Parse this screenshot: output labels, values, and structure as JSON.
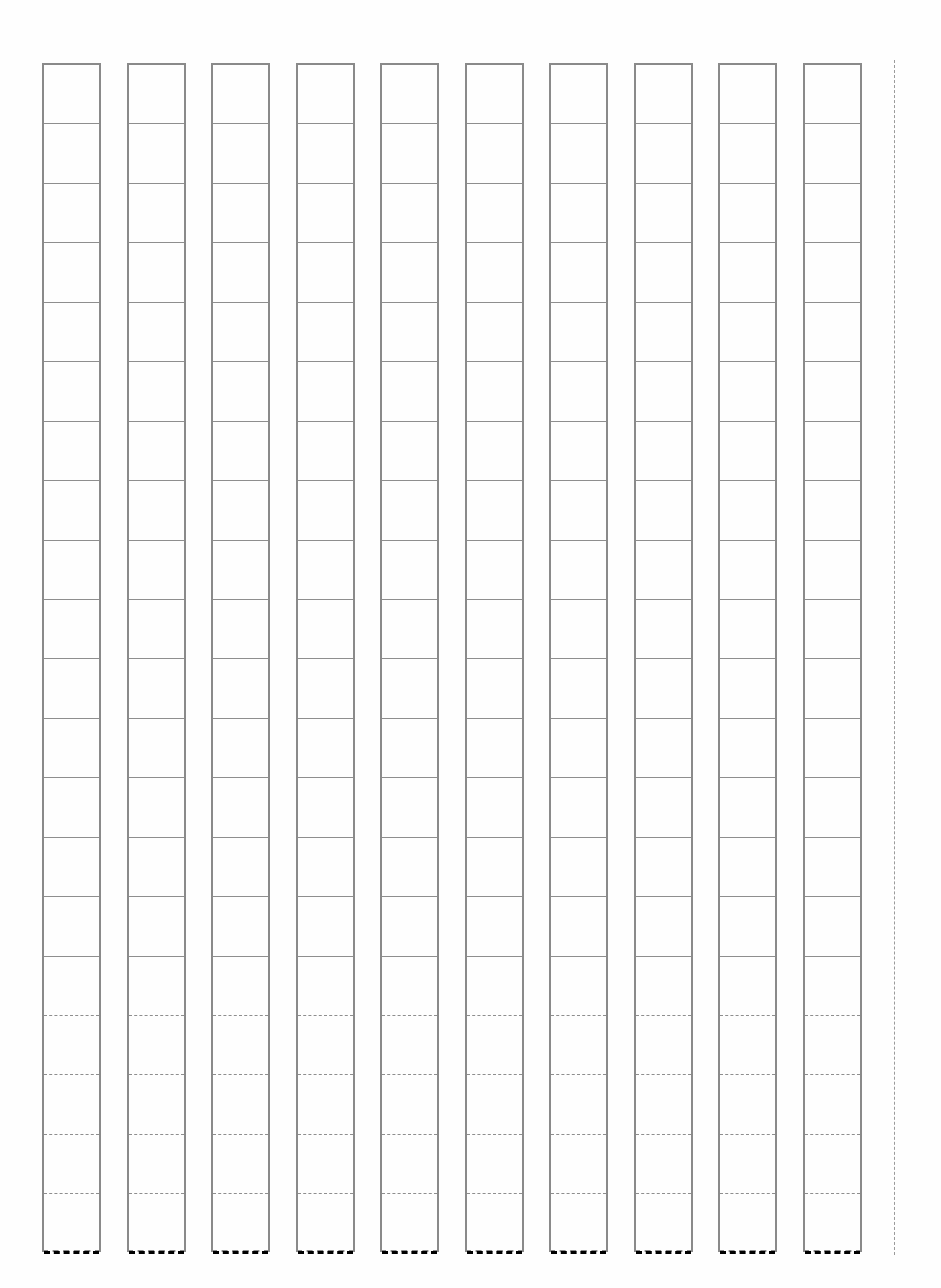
{
  "sheet": {
    "type": "blank grid writing sheet",
    "line_color": "#8a8a8a",
    "background_color": "#fefefe",
    "columns": 10,
    "rows_per_column": 20,
    "column_left_positions_px": [
      42,
      127,
      211,
      296,
      380,
      465,
      549,
      634,
      718,
      803
    ],
    "column_width_px": 59,
    "grid_top_px": 63,
    "grid_bottom_px": 1252,
    "right_margin_line_x_px": 894,
    "cells": []
  }
}
